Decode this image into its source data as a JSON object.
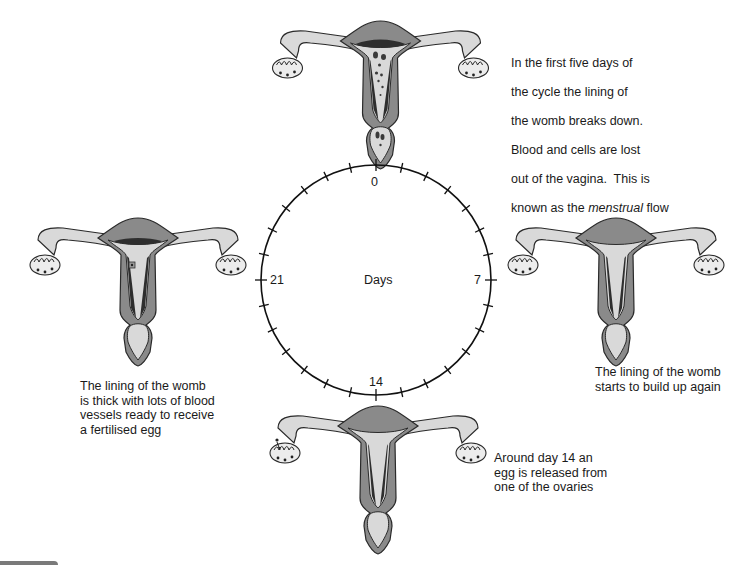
{
  "diagram": {
    "center_label": "Days",
    "day_labels": [
      {
        "value": "0",
        "position": "top"
      },
      {
        "value": "7",
        "position": "right"
      },
      {
        "value": "14",
        "position": "bottom"
      },
      {
        "value": "21",
        "position": "left"
      }
    ],
    "tick_count": 28,
    "colors": {
      "muscle": "#8a8a8a",
      "lining": "#d9d9d9",
      "dark_lining": "#3a3a3a",
      "outline": "#2a2a2a",
      "circle": "#111111"
    },
    "stages": [
      {
        "id": "menstruation",
        "day": "0",
        "caption_lines": [
          "In the first five days of",
          "the cycle the lining of",
          "the womb breaks down.",
          "Blood and cells are lost",
          "out of the vagina.  This is"
        ],
        "caption_tail_prefix": "known as the ",
        "caption_tail_italic": "menstrual",
        "caption_tail_suffix": " flow"
      },
      {
        "id": "rebuild",
        "day": "7",
        "caption": "The lining of the womb\nstarts to build up again"
      },
      {
        "id": "ovulation",
        "day": "14",
        "caption": "Around day 14 an\negg is released from\none of the ovaries"
      },
      {
        "id": "thick-lining",
        "day": "21",
        "caption": "The lining of the womb\nis thick with lots of blood\nvessels ready to receive\na fertilised egg"
      }
    ]
  }
}
